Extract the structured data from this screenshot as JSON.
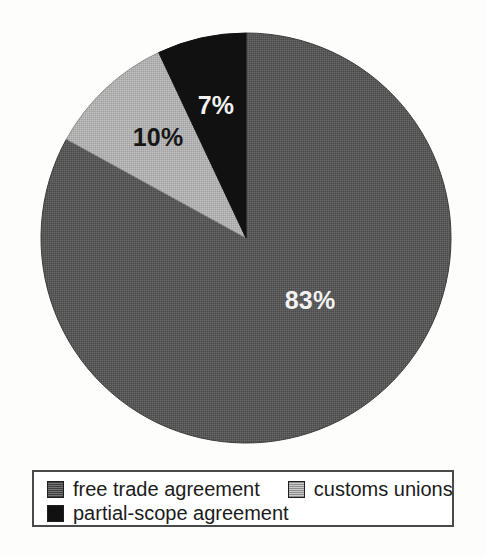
{
  "chart_data": {
    "type": "pie",
    "title": "",
    "categories": [
      "free trade agreement",
      "customs unions",
      "partial-scope agreement"
    ],
    "values": [
      83,
      10,
      7
    ],
    "unit": "%",
    "data_labels": [
      "83%",
      "10%",
      "7%"
    ],
    "colors": [
      "#5a5a5a",
      "#b3b3b3",
      "#111111"
    ],
    "label_colors": [
      "#f2f2f2",
      "#161616",
      "#f2f2f2"
    ],
    "start_angle_deg": 0,
    "direction": "clockwise",
    "legend_position": "bottom",
    "grid": false,
    "xlabel": "",
    "ylabel": "",
    "slices": [
      {
        "name": "free trade agreement",
        "value": 83,
        "label": "83%",
        "color": "#5a5a5a",
        "fill": "dark-gray-dither",
        "label_color": "#f2f2f2",
        "label_x": 310,
        "label_y": 300,
        "start_deg": 0,
        "sweep_deg": 298.8
      },
      {
        "name": "customs unions",
        "value": 10,
        "label": "10%",
        "color": "#b3b3b3",
        "fill": "light-gray-dither",
        "label_color": "#161616",
        "label_x": 158,
        "label_y": 137,
        "start_deg": 298.8,
        "sweep_deg": 36.0
      },
      {
        "name": "partial-scope agreement",
        "value": 7,
        "label": "7%",
        "color": "#111111",
        "fill": "black",
        "label_color": "#f2f2f2",
        "label_x": 216,
        "label_y": 105,
        "start_deg": 334.8,
        "sweep_deg": 25.2
      }
    ]
  },
  "legend": {
    "rows": [
      [
        {
          "label": "free trade agreement",
          "swatch": "dark-gray-dither"
        },
        {
          "label": "customs unions",
          "swatch": "light-gray-dither"
        }
      ],
      [
        {
          "label": "partial-scope agreement",
          "swatch": "black"
        }
      ]
    ]
  },
  "geometry": {
    "center_x": 246,
    "center_y": 238,
    "radius": 205
  }
}
